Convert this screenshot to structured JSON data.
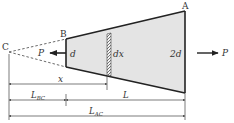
{
  "diagram": {
    "type": "tapered bar free-body diagram",
    "points": {
      "A": "A",
      "B": "B",
      "C": "C"
    },
    "diameters": {
      "small_end": "d",
      "large_end": "2d"
    },
    "element": {
      "label": "dx"
    },
    "loads": {
      "left": "P",
      "right": "P"
    },
    "dimensions": {
      "x": "x",
      "L_BC": {
        "base": "L",
        "sub": "BC"
      },
      "L": "L",
      "L_AC": {
        "base": "L",
        "sub": "AC"
      }
    },
    "colors": {
      "fill": "#e4e4e4",
      "stroke": "#222222",
      "text": "#333333"
    }
  }
}
